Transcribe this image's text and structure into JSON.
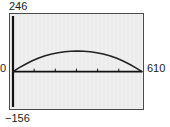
{
  "chart_data": {
    "type": "line",
    "title": "",
    "subtitle": "",
    "xlabel": "",
    "ylabel": "",
    "xlim": [
      0,
      610
    ],
    "ylim": [
      -156,
      246
    ],
    "grid": false,
    "legend": null,
    "axis_labels": {
      "y_max": "246",
      "y_min": "−156",
      "origin": "0",
      "x_max": "610"
    },
    "x_ticks": [
      100,
      200,
      300,
      400,
      500
    ],
    "x_tick_labels": [
      "",
      "",
      "",
      "",
      ""
    ],
    "series": [
      {
        "name": "curve",
        "color": "#222222",
        "x": [
          0,
          30,
          61,
          91,
          122,
          152,
          183,
          213,
          244,
          274,
          305,
          335,
          366,
          396,
          427,
          457,
          488,
          518,
          549,
          579,
          610
        ],
        "y": [
          0,
          18,
          34,
          48,
          60,
          70,
          78,
          84,
          88,
          90,
          91,
          90,
          88,
          84,
          78,
          70,
          60,
          48,
          34,
          18,
          0
        ]
      }
    ]
  },
  "figure": {
    "background_color": "#ffffff",
    "plot_background_color": "#ebebeb",
    "frame_color": "#4a4a4a",
    "axis_color": "#111111",
    "curve_color": "#222222"
  }
}
